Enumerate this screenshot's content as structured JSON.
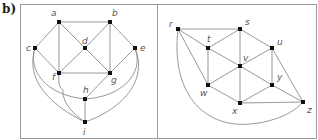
{
  "figure_label": "b)",
  "colors": {
    "panel_border": "#9a9a9a",
    "edge": "#8c8c8c",
    "node": "#111111",
    "label": "#555555"
  },
  "panels": [
    {
      "name": "left-graph",
      "rect": [
        20,
        4,
        137,
        134
      ],
      "nodes": [
        {
          "id": "a",
          "x": 59,
          "y": 22,
          "lx": 51,
          "ly": 16
        },
        {
          "id": "b",
          "x": 110,
          "y": 22,
          "lx": 112,
          "ly": 16
        },
        {
          "id": "c",
          "x": 35,
          "y": 48,
          "lx": 26,
          "ly": 51
        },
        {
          "id": "d",
          "x": 85,
          "y": 48,
          "lx": 82,
          "ly": 44
        },
        {
          "id": "e",
          "x": 135,
          "y": 48,
          "lx": 140,
          "ly": 51
        },
        {
          "id": "f",
          "x": 59,
          "y": 73,
          "lx": 52,
          "ly": 80
        },
        {
          "id": "g",
          "x": 110,
          "y": 73,
          "lx": 111,
          "ly": 83
        },
        {
          "id": "h",
          "x": 85,
          "y": 99,
          "lx": 83,
          "ly": 93
        },
        {
          "id": "i",
          "x": 85,
          "y": 122,
          "lx": 83,
          "ly": 135
        }
      ],
      "edges": [
        [
          "a",
          "b"
        ],
        [
          "a",
          "c"
        ],
        [
          "a",
          "d"
        ],
        [
          "a",
          "f"
        ],
        [
          "b",
          "d"
        ],
        [
          "b",
          "e"
        ],
        [
          "b",
          "g"
        ],
        [
          "c",
          "f"
        ],
        [
          "d",
          "f"
        ],
        [
          "d",
          "g"
        ],
        [
          "e",
          "g"
        ],
        [
          "f",
          "g"
        ],
        [
          "g",
          "h"
        ],
        [
          "h",
          "i"
        ]
      ],
      "curves": [
        {
          "from": "c",
          "to": "h",
          "d": "M35,48 C28,70 45,95 85,99"
        },
        {
          "from": "c",
          "to": "i",
          "d": "M35,48 C25,80 50,105 85,122"
        },
        {
          "from": "f",
          "to": "i",
          "d": "M59,73 C58,85 60,88 63,90 C62,100 70,112 85,122"
        },
        {
          "from": "e",
          "to": "h",
          "d": "M135,48 C145,75 120,97 85,99"
        },
        {
          "from": "e",
          "to": "i",
          "d": "M135,48 C150,85 115,112 85,122"
        }
      ]
    },
    {
      "name": "right-graph",
      "rect": [
        157,
        4,
        159,
        134
      ],
      "nodes": [
        {
          "id": "r",
          "x": 178,
          "y": 29,
          "lx": 169,
          "ly": 27
        },
        {
          "id": "s",
          "x": 240,
          "y": 29,
          "lx": 245,
          "ly": 25
        },
        {
          "id": "t",
          "x": 208,
          "y": 48,
          "lx": 207,
          "ly": 42
        },
        {
          "id": "u",
          "x": 272,
          "y": 48,
          "lx": 277,
          "ly": 45
        },
        {
          "id": "v",
          "x": 240,
          "y": 66,
          "lx": 243,
          "ly": 61
        },
        {
          "id": "w",
          "x": 208,
          "y": 85,
          "lx": 200,
          "ly": 96
        },
        {
          "id": "x",
          "x": 240,
          "y": 103,
          "lx": 232,
          "ly": 114
        },
        {
          "id": "y",
          "x": 272,
          "y": 85,
          "lx": 277,
          "ly": 80
        },
        {
          "id": "z",
          "x": 303,
          "y": 102,
          "lx": 307,
          "ly": 113
        }
      ],
      "edges": [
        [
          "r",
          "s"
        ],
        [
          "r",
          "t"
        ],
        [
          "r",
          "w"
        ],
        [
          "s",
          "t"
        ],
        [
          "s",
          "u"
        ],
        [
          "s",
          "v"
        ],
        [
          "t",
          "v"
        ],
        [
          "t",
          "w"
        ],
        [
          "u",
          "v"
        ],
        [
          "u",
          "y"
        ],
        [
          "u",
          "z"
        ],
        [
          "v",
          "w"
        ],
        [
          "v",
          "x"
        ],
        [
          "v",
          "y"
        ],
        [
          "w",
          "x"
        ],
        [
          "x",
          "y"
        ],
        [
          "x",
          "z"
        ],
        [
          "y",
          "z"
        ]
      ],
      "curves": [
        {
          "from": "r",
          "to": "z",
          "d": "M178,29 C170,100 210,128 250,124 C275,122 295,112 303,102"
        }
      ]
    }
  ]
}
